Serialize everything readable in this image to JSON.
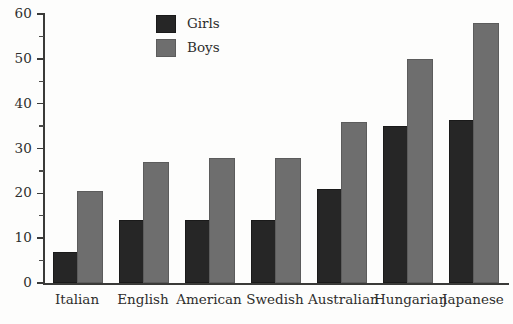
{
  "chart_data": {
    "type": "bar",
    "title": "",
    "xlabel": "",
    "ylabel": "",
    "ylim": [
      0,
      60
    ],
    "y_major_ticks": [
      0,
      10,
      20,
      30,
      40,
      50,
      60
    ],
    "y_minor_ticks": [
      5,
      15,
      25,
      35,
      45,
      55
    ],
    "grid": false,
    "legend_position": "top-center",
    "categories": [
      "Italian",
      "English",
      "American",
      "Swedish",
      "Australian",
      "Hungarian",
      "Japanese"
    ],
    "series": [
      {
        "name": "Girls",
        "color": "#262626",
        "values": [
          6.5,
          13.5,
          13.5,
          13.5,
          20.5,
          34.5,
          36
        ]
      },
      {
        "name": "Boys",
        "color": "#6e6e6e",
        "values": [
          20,
          26.5,
          27.5,
          27.5,
          35.5,
          49.5,
          57.5
        ]
      }
    ]
  },
  "axis": {
    "tick_labels": [
      "60",
      "50",
      "40",
      "30",
      "20",
      "10",
      "0"
    ]
  },
  "legend": {
    "entries": [
      {
        "label": "Girls",
        "swatch": "girls-swatch"
      },
      {
        "label": "Boys",
        "swatch": "boys-swatch"
      }
    ]
  }
}
